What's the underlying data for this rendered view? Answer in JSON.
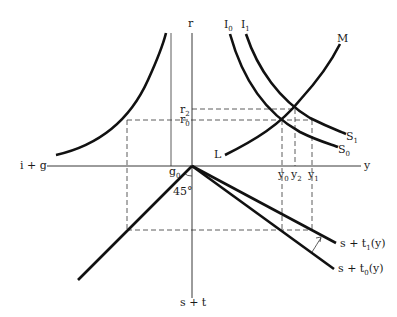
{
  "diagram": {
    "axes": {
      "vertical_top_label": "r",
      "vertical_bottom_label": "s + t",
      "horizontal_right_label": "y",
      "horizontal_left_label": "i + g"
    },
    "curves": {
      "I0": {
        "label": "I",
        "sub": "0"
      },
      "I1": {
        "label": "I",
        "sub": "1"
      },
      "S0": {
        "label": "S",
        "sub": "0"
      },
      "S1": {
        "label": "S",
        "sub": "1"
      },
      "M": {
        "label": "M"
      },
      "L": {
        "label": "L"
      },
      "st1": {
        "label": "s + t",
        "sub": "1",
        "suffix": "(y)"
      },
      "st0": {
        "label": "s + t",
        "sub": "0",
        "suffix": "(y)"
      }
    },
    "ticks": {
      "r2": {
        "label": "r",
        "sub": "2"
      },
      "r0": {
        "label": "r",
        "sub": "0"
      },
      "g0": {
        "label": "g",
        "sub": "0"
      },
      "y0": {
        "label": "y",
        "sub": "0"
      },
      "y2": {
        "label": "y",
        "sub": "2"
      },
      "y1": {
        "label": "y",
        "sub": "1"
      }
    },
    "angle_label": "45°"
  }
}
